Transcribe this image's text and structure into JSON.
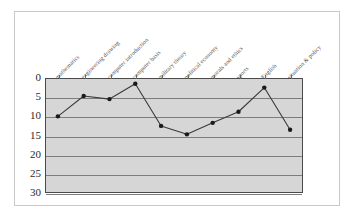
{
  "figure": {
    "background_color": "#ffffff",
    "frame_color": "#c9c9c9",
    "plot_background_color": "#d6d6d6",
    "plot_border_color": "#4a4a4a",
    "gridline_color": "#7d7d7d",
    "series_color": "#3a3a3a",
    "marker_color": "#1a1a1a"
  },
  "chart_data": {
    "type": "line",
    "title": "",
    "subtitle": "",
    "xlabel": "",
    "ylabel": "",
    "grid": true,
    "legend": false,
    "legend_position": "none",
    "y_axis_inverted": true,
    "ylim": [
      0,
      30
    ],
    "yticks": [
      0,
      5,
      10,
      15,
      20,
      25,
      30
    ],
    "ytick_labels": [
      "0",
      "5",
      "10",
      "15",
      "20",
      "25",
      "30"
    ],
    "categories": [
      "mathematics",
      "engineering drawing",
      "computer introduction",
      "computer basis",
      "military theory",
      "political economy",
      "morals and ethics",
      "sports",
      "English",
      "situation & policy"
    ],
    "values": [
      10.0,
      4.7,
      5.5,
      1.5,
      12.5,
      14.7,
      11.7,
      8.8,
      2.5,
      13.5
    ],
    "series": [
      {
        "name": "series-1",
        "values": [
          10.0,
          4.7,
          5.5,
          1.5,
          12.5,
          14.7,
          11.7,
          8.8,
          2.5,
          13.5
        ],
        "marker": "circle",
        "color": "#3a3a3a"
      }
    ]
  }
}
